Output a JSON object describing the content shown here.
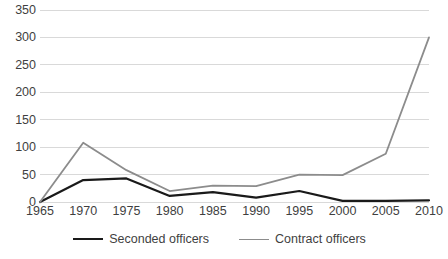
{
  "chart_data": {
    "type": "line",
    "title": "",
    "subtitle": "",
    "xlabel": "",
    "ylabel": "",
    "x": [
      1965,
      1970,
      1975,
      1980,
      1985,
      1990,
      1995,
      2000,
      2005,
      2010
    ],
    "x_tick_labels": [
      "1965",
      "1970",
      "1975",
      "1980",
      "1985",
      "1990",
      "1995",
      "2000",
      "2005",
      "2010"
    ],
    "y_tick_labels": [
      "0",
      "50",
      "100",
      "150",
      "200",
      "250",
      "300",
      "350"
    ],
    "y_ticks": [
      0,
      50,
      100,
      150,
      200,
      250,
      300,
      350
    ],
    "xlim": [
      1965,
      2010
    ],
    "ylim": [
      0,
      350
    ],
    "grid": "horizontal",
    "legend_position": "bottom",
    "series": [
      {
        "name": "Seconded officers",
        "color": "#1a1a1a",
        "width": 2.2,
        "values": [
          0,
          40,
          43,
          11,
          18,
          8,
          20,
          2,
          2,
          3
        ]
      },
      {
        "name": "Contract officers",
        "color": "#8c8c8c",
        "width": 1.8,
        "values": [
          0,
          108,
          58,
          20,
          30,
          29,
          50,
          49,
          88,
          300
        ]
      }
    ]
  },
  "axes": {
    "grid_color": "#d9d9d9",
    "tick_label_color": "#3f3f3f"
  }
}
